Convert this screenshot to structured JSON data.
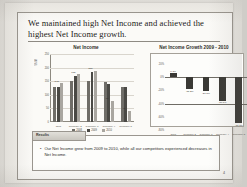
{
  "slide": {
    "title": "We maintained high Net Income and achieved the highest Net Income growth.",
    "page_number": "4"
  },
  "results": {
    "tab_label": "Results",
    "bullet_marker": "•",
    "bullet_text": "Our Net Income grew from 2009 to 2010, while all our competitors experienced decreases in Net Income."
  },
  "colors": {
    "series_2008": "#6f6d68",
    "series_2009": "#4a4945",
    "series_2010": "#a9a6a0",
    "growth_bar": "#3a3935",
    "axis": "#8d8980",
    "paper": "#fbfaf7"
  },
  "chart_data": [
    {
      "type": "bar",
      "title": "Net Income",
      "xlabel": "",
      "ylabel": "$MM",
      "ylim": [
        0,
        250
      ],
      "yticks": [
        0,
        50,
        100,
        150,
        200,
        250
      ],
      "grid": true,
      "legend_position": "bottom",
      "categories": [
        "Ours",
        "Company 2",
        "Company 3",
        "Company 4",
        "Company 5"
      ],
      "series": [
        {
          "name": "2008",
          "values": [
            128,
            152,
            150,
            148,
            130
          ]
        },
        {
          "name": "2009",
          "values": [
            130,
            168,
            185,
            140,
            128
          ]
        },
        {
          "name": "2010",
          "values": [
            143,
            175,
            188,
            78,
            42
          ]
        }
      ],
      "data_labels": [
        "143",
        "175",
        "188",
        "78",
        "42"
      ]
    },
    {
      "type": "bar",
      "title": "Net Income Growth 2009 - 2010",
      "xlabel": "",
      "ylabel": "",
      "ylim": [
        -80,
        20
      ],
      "yticks": [
        20,
        0,
        -20,
        -40,
        -60,
        -80
      ],
      "ytick_labels": [
        "20%",
        "0%",
        "-20%",
        "-40%",
        "-60%",
        "-80%"
      ],
      "grid": false,
      "legend_position": "none",
      "categories": [
        "Ours",
        "Company 2",
        "Company 3",
        "Company 4",
        "Company 5"
      ],
      "values": [
        6.3,
        -18.2,
        -21.3,
        -36.1,
        -70.1
      ],
      "data_labels": [
        "6.3%",
        "-18.2%",
        "-21.3%",
        "-36.1%",
        "-70.1%"
      ]
    }
  ]
}
